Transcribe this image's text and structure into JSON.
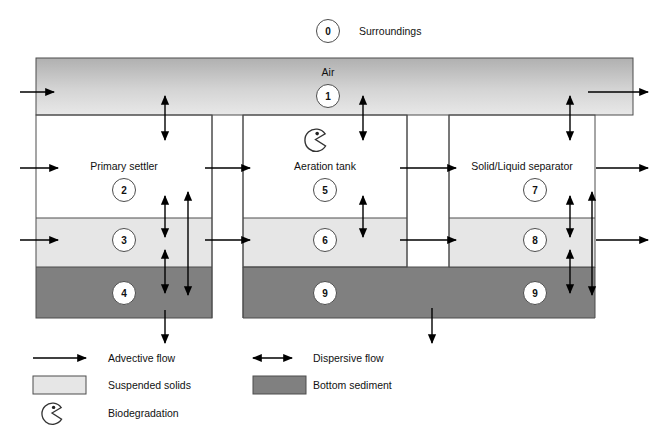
{
  "figure": {
    "surroundings_label": "Surroundings",
    "air_label": "Air",
    "colors": {
      "suspended_solids": "#e6e6e6",
      "bottom_sediment": "#808080",
      "air_top": "#b4b4b4",
      "air_bottom": "#e3e3e3",
      "outline": "#4d4d4d",
      "arrow": "#000000",
      "text": "#111111"
    }
  },
  "compartments": [
    {
      "id": "0",
      "number": "0",
      "label": "Surroundings",
      "media": "external"
    },
    {
      "id": "1",
      "number": "1",
      "label": "Air",
      "media": "air"
    },
    {
      "id": "2",
      "number": "2",
      "label": "Primary settler",
      "media": "water"
    },
    {
      "id": "3",
      "number": "3",
      "label": "",
      "media": "suspended-solids"
    },
    {
      "id": "4",
      "number": "4",
      "label": "",
      "media": "bottom-sediment"
    },
    {
      "id": "5",
      "number": "5",
      "label": "Aeration tank",
      "media": "water"
    },
    {
      "id": "6",
      "number": "6",
      "label": "",
      "media": "suspended-solids"
    },
    {
      "id": "7",
      "number": "7",
      "label": "Solid/Liquid separator",
      "media": "water"
    },
    {
      "id": "8",
      "number": "8",
      "label": "",
      "media": "suspended-solids"
    },
    {
      "id": "9",
      "number": "9",
      "label": "",
      "media": "bottom-sediment"
    },
    {
      "id": "9b",
      "number": "9",
      "label": "",
      "media": "bottom-sediment"
    }
  ],
  "unit_labels": {
    "primary_settler": "Primary settler",
    "aeration_tank": "Aeration tank",
    "separator": "Solid/Liquid separator"
  },
  "legend": {
    "items": [
      {
        "key": "advective",
        "icon": "single-arrow-icon",
        "label": "Advective flow"
      },
      {
        "key": "dispersive",
        "icon": "double-arrow-icon",
        "label": "Dispersive flow"
      },
      {
        "key": "suspended",
        "icon": "light-gray-swatch-icon",
        "label": "Suspended solids"
      },
      {
        "key": "sediment",
        "icon": "dark-gray-swatch-icon",
        "label": "Bottom sediment"
      },
      {
        "key": "biodegradation",
        "icon": "pacman-icon",
        "label": "Biodegradation"
      }
    ]
  },
  "icons": {
    "biodegradation": "pacman-icon"
  }
}
